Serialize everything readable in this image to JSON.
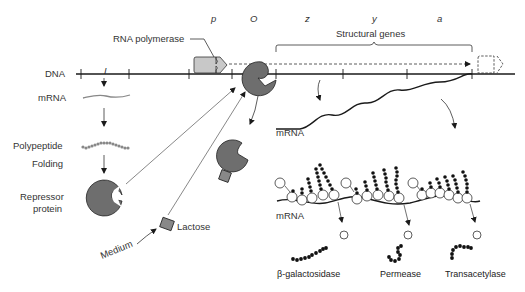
{
  "diagram": {
    "gene_labels": {
      "i": "I",
      "p": "p",
      "o": "O",
      "z": "z",
      "y": "y",
      "a": "a"
    },
    "labels": {
      "rna_polymerase": "RNA polymerase",
      "structural_genes": "Structural genes",
      "dna": "DNA",
      "mrna_left": "mRNA",
      "polypeptide": "Polypeptide",
      "folding": "Folding",
      "repressor_line1": "Repressor",
      "repressor_line2": "protein",
      "lactose": "Lactose",
      "medium": "Medium",
      "mrna_transcript": "mRNA",
      "mrna_polysome": "mRNA"
    },
    "products": [
      {
        "name": "β-galactosidase"
      },
      {
        "name": "Permease"
      },
      {
        "name": "Transacetylase"
      }
    ],
    "colors": {
      "protein_fill": "#6e6e6e",
      "polymerase_fill": "#c8c8c8",
      "line": "#1a1a1a",
      "text": "#333333"
    }
  }
}
